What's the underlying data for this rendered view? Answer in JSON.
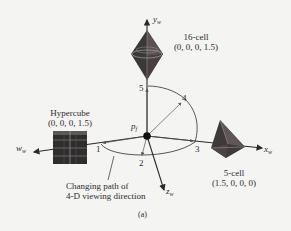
{
  "figure": {
    "panel_label": "(a)",
    "origin_label": "p",
    "origin_subscript": "f",
    "axes": {
      "y": {
        "name": "y",
        "subscript": "w"
      },
      "x": {
        "name": "x",
        "subscript": "w"
      },
      "z": {
        "name": "z",
        "subscript": "w"
      },
      "w": {
        "name": "w",
        "subscript": "w"
      }
    },
    "objects": [
      {
        "id": "16-cell",
        "name": "16-cell",
        "coords": "(0, 0, 0, 1.5)"
      },
      {
        "id": "hypercube",
        "name": "Hypercube",
        "coords": "(0, 0, 0, 1.5)"
      },
      {
        "id": "5-cell",
        "name": "5-cell",
        "coords": "(1.5, 0, 0, 0)"
      }
    ],
    "path_points": [
      "1",
      "2",
      "3",
      "4",
      "5"
    ],
    "path_caption_line1": "Changing path of",
    "path_caption_line2": "4-D viewing direction"
  }
}
